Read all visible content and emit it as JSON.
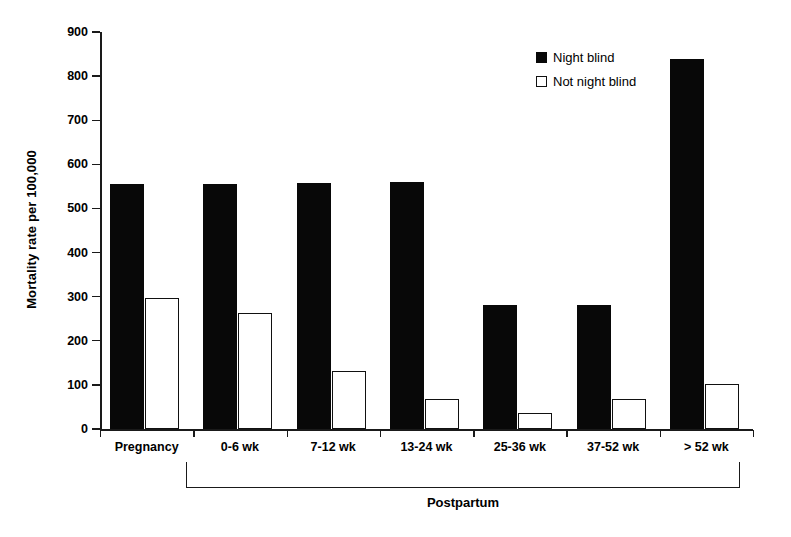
{
  "chart_data": {
    "type": "bar",
    "title": "",
    "xlabel": "Postpartum",
    "ylabel": "Mortality rate per 100,000",
    "ylim": [
      0,
      900
    ],
    "ytick_labels": [
      "900",
      "800",
      "700",
      "600",
      "500",
      "400",
      "300",
      "200",
      "100",
      "0"
    ],
    "ytick_values": [
      900,
      800,
      700,
      600,
      500,
      400,
      300,
      200,
      100,
      0
    ],
    "grid": false,
    "legend_position": "upper-center-right",
    "categories": [
      "Pregnancy",
      "0-6 wk",
      "7-12 wk",
      "13-24 wk",
      "25-36 wk",
      "37-52 wk",
      "> 52 wk"
    ],
    "group_bracket_label": "Postpartum",
    "group_bracket_categories": [
      "0-6 wk",
      "7-12 wk",
      "13-24 wk",
      "25-36 wk",
      "37-52 wk",
      "> 52 wk"
    ],
    "series": [
      {
        "name": "Night blind",
        "style": "filled",
        "color": "#080808",
        "values": [
          555,
          555,
          558,
          560,
          281,
          282,
          838
        ]
      },
      {
        "name": "Not night blind",
        "style": "hollow",
        "color": "#ffffff",
        "values": [
          297,
          263,
          132,
          68,
          37,
          68,
          101
        ]
      }
    ]
  },
  "legend": {
    "items": [
      {
        "label": "Night blind",
        "swatch": "filled-square-icon"
      },
      {
        "label": "Not night blind",
        "swatch": "hollow-square-icon"
      }
    ]
  }
}
